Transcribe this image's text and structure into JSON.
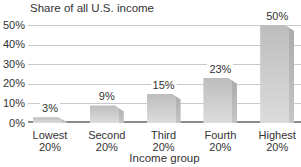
{
  "chart_data": {
    "type": "bar",
    "title": "Share of all U.S. income",
    "xlabel": "Income group",
    "ylabel": "",
    "categories": [
      [
        "Lowest",
        "20%"
      ],
      [
        "Second",
        "20%"
      ],
      [
        "Third",
        "20%"
      ],
      [
        "Fourth",
        "20%"
      ],
      [
        "Highest",
        "20%"
      ]
    ],
    "values": [
      3,
      9,
      15,
      23,
      50
    ],
    "value_labels": [
      "3%",
      "9%",
      "15%",
      "23%",
      "50%"
    ],
    "yticks": [
      {
        "value": 0,
        "label": "0%"
      },
      {
        "value": 10,
        "label": "10%"
      },
      {
        "value": 20,
        "label": "20%"
      },
      {
        "value": 30,
        "label": "30%"
      },
      {
        "value": 40,
        "label": "40%"
      },
      {
        "value": 50,
        "label": "50%"
      }
    ],
    "ylim": [
      0,
      50
    ],
    "grid": true,
    "legend": "none"
  },
  "colors": {
    "background": "#ffffff",
    "text": "#333333",
    "gridline": "#c9c9c9",
    "baseline": "#8c8c8c",
    "bar_top": "#bdbdbd",
    "bar_bottom": "#dcdcdc",
    "bar_edge_shade": "rgba(0,0,0,0.10)"
  }
}
